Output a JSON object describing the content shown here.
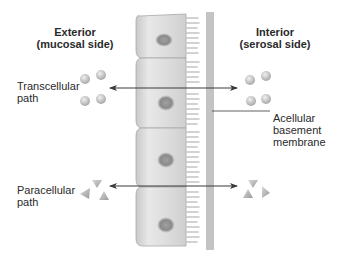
{
  "diagram": {
    "sides": {
      "exterior": {
        "line1": "Exterior",
        "line2": "(mucosal side)"
      },
      "interior": {
        "line1": "Interior",
        "line2": "(serosal side)"
      }
    },
    "pathways": [
      {
        "id": "transcellular",
        "line1": "Transcellular",
        "line2": "path",
        "solute_shape": "circle",
        "direction": "bidirectional",
        "route": "through cell"
      },
      {
        "id": "paracellular",
        "line1": "Paracellular",
        "line2": "path",
        "solute_shape": "triangle",
        "direction": "bidirectional",
        "route": "between cells"
      }
    ],
    "membrane": {
      "line1": "Acellular",
      "line2": "basement",
      "line3": "membrane"
    },
    "cells": {
      "count": 4,
      "features": [
        "nucleus",
        "microvilli"
      ]
    },
    "colors": {
      "cell_fill": "#d9d9d9",
      "cell_highlight": "#f2f2f2",
      "nucleus": "#9a9a9a",
      "arrow": "#3a3a3a",
      "solute": "#b0b0b0",
      "membrane": "#7a7a7a"
    }
  }
}
